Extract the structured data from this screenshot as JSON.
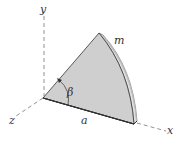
{
  "diagram": {
    "type": "3d-geometry",
    "axes": {
      "x_label": "x",
      "y_label": "y",
      "z_label": "z"
    },
    "labels": {
      "mass": "m",
      "radius": "a",
      "angle": "β"
    },
    "colors": {
      "face": "#cfcfcf",
      "edge_thickness": "#b4b4b4",
      "rim_highlight": "#e2e2e2",
      "outline": "#333333",
      "axis": "#666666"
    }
  }
}
